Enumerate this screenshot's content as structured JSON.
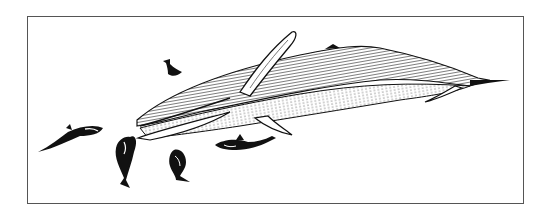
{
  "illustration": {
    "subject": "Blue whale with killer whales (orcas) attacking",
    "style": "black-and-white pen-and-ink engraving",
    "colors": {
      "ink": "#111111",
      "paper": "#ffffff",
      "frame": "#555555"
    },
    "elements": [
      {
        "name": "large-whale",
        "description": "Large baleen whale swimming diagonally, head lower-left, tail upper-right"
      },
      {
        "name": "orca-1",
        "description": "Orca lunging left, far left"
      },
      {
        "name": "orca-2",
        "description": "Orca diving, curved body below whale's jaw"
      },
      {
        "name": "orca-3",
        "description": "Orca curled upward, center-bottom"
      },
      {
        "name": "orca-4",
        "description": "Orca swimming horizontally under whale's belly"
      },
      {
        "name": "orca-5",
        "description": "Small orca tail/fluke visible above whale's head"
      }
    ]
  }
}
